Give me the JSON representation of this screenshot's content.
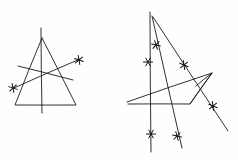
{
  "figure": {
    "background_color": "#fefefe",
    "ink_color": "#1a1a1a",
    "width": 238,
    "height": 160
  },
  "left_figure": {
    "name": "triangle-with-transversals",
    "shapes": [
      {
        "name": "triangle-outline",
        "type": "polyline",
        "points": "42,38 15,105 76,105 42,38"
      },
      {
        "name": "vertical-axis-line",
        "type": "line",
        "points": "41,28 42,113"
      },
      {
        "name": "transversal-line-ascending",
        "type": "line",
        "points": "14,88 80,59"
      },
      {
        "name": "transversal-line-descending",
        "type": "line",
        "points": "18,66 73,80"
      }
    ],
    "markers": [
      {
        "name": "asterisk-marker-left",
        "x": 13,
        "y": 88,
        "size": 4.5,
        "rotation": 18
      },
      {
        "name": "asterisk-marker-upper-right",
        "x": 79,
        "y": 60,
        "size": 4.5,
        "rotation": 20
      }
    ]
  },
  "right_figure": {
    "name": "star-polygon-with-rays",
    "shapes": [
      {
        "name": "star-polygon-outline",
        "type": "polyline",
        "points": "127,102 212,73 190,104 128,104"
      },
      {
        "name": "star-polygon-inner-edge",
        "type": "line",
        "points": "212,73 190,104"
      },
      {
        "name": "vertical-axis-line",
        "type": "line",
        "points": "150,12 151,152"
      },
      {
        "name": "ray-apex-to-lower-right",
        "type": "line",
        "points": "152,16 182,148"
      },
      {
        "name": "ray-apex-to-far-lower-right",
        "type": "line",
        "points": "153,17 228,131"
      },
      {
        "name": "star-upper-right-arm",
        "type": "line",
        "points": "196,86 212,73"
      }
    ],
    "markers": [
      {
        "name": "asterisk-marker-upper",
        "x": 156,
        "y": 45,
        "size": 4.5,
        "rotation": 12
      },
      {
        "name": "asterisk-marker-axis-upper",
        "x": 148,
        "y": 62,
        "size": 4.5,
        "rotation": 0
      },
      {
        "name": "asterisk-marker-diagonal-mid",
        "x": 184,
        "y": 65,
        "size": 4.5,
        "rotation": 22
      },
      {
        "name": "asterisk-marker-diagonal-lower",
        "x": 213,
        "y": 106,
        "size": 4.5,
        "rotation": 22
      },
      {
        "name": "asterisk-marker-axis-bottom",
        "x": 151,
        "y": 134,
        "size": 4.5,
        "rotation": 0
      },
      {
        "name": "asterisk-marker-ray-bottom",
        "x": 177,
        "y": 136,
        "size": 4.5,
        "rotation": 14
      }
    ]
  }
}
